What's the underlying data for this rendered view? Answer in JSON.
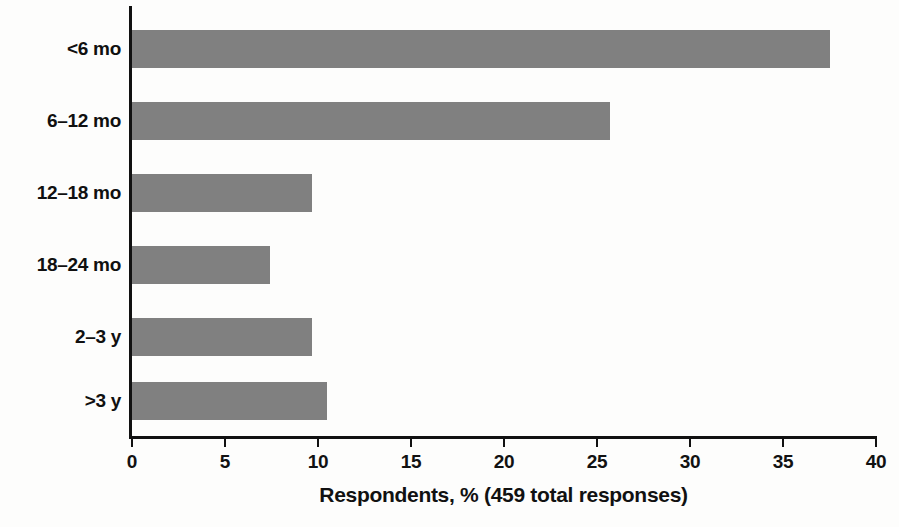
{
  "chart_data": {
    "type": "bar",
    "orientation": "horizontal",
    "title": "",
    "xlabel": "Respondents, % (459 total responses)",
    "ylabel": "",
    "categories": [
      "<6 mo",
      "6–12 mo",
      "12–18 mo",
      "18–24 mo",
      "2–3 y",
      ">3 y"
    ],
    "values": [
      37.5,
      25.7,
      9.7,
      7.4,
      9.7,
      10.5
    ],
    "series": [
      {
        "name": "Respondents, %",
        "values": [
          37.5,
          25.7,
          9.7,
          7.4,
          9.7,
          10.5
        ]
      }
    ],
    "xlim": [
      0,
      40
    ],
    "xticks": [
      0,
      5,
      10,
      15,
      20,
      25,
      30,
      35,
      40
    ],
    "xtick_labels": [
      "0",
      "5",
      "10",
      "15",
      "20",
      "25",
      "30",
      "35",
      "40"
    ],
    "grid": false,
    "legend": false,
    "bar_color": "#808080",
    "axis_color": "#111111",
    "background_color": "#ffffff",
    "total_responses": "459"
  }
}
